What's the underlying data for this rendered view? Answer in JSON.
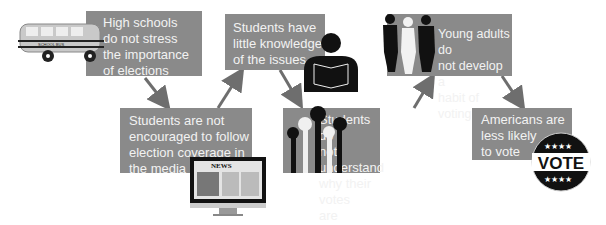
{
  "diagram": {
    "type": "flowchart",
    "colors": {
      "box_fill": "#8a8a8a",
      "box_text": "#f2f2f2",
      "arrow": "#6e6e6e"
    },
    "nodes": [
      {
        "id": "high-schools",
        "label": "High schools\ndo not stress\nthe importance\nof elections",
        "icon": "school-bus-icon"
      },
      {
        "id": "not-encouraged",
        "label": "Students are not\nencouraged to follow\nelection coverage in\nthe media",
        "icon": "news-monitor-icon"
      },
      {
        "id": "little-knowledge",
        "label": "Students have\nlittle knowledge\nof the issues",
        "icon": "reading-student-icon"
      },
      {
        "id": "not-understand",
        "label": "Students do\nnot understand\nwhy their votes\nare important",
        "icon": "raised-hands-icon"
      },
      {
        "id": "no-habit",
        "label": "Young adults do\nnot develop a\nhabit of voting",
        "icon": "young-adults-icon"
      },
      {
        "id": "less-likely",
        "label": "Americans are\nless likely\nto vote",
        "icon": "vote-button-icon"
      }
    ],
    "edges": [
      [
        "high-schools",
        "not-encouraged"
      ],
      [
        "not-encouraged",
        "little-knowledge"
      ],
      [
        "little-knowledge",
        "not-understand"
      ],
      [
        "not-understand",
        "no-habit"
      ],
      [
        "no-habit",
        "less-likely"
      ]
    ],
    "icon_text": {
      "bus_sign": "SCHOOL BUS",
      "news_header": "NEWS",
      "vote_badge": "VOTE"
    }
  }
}
